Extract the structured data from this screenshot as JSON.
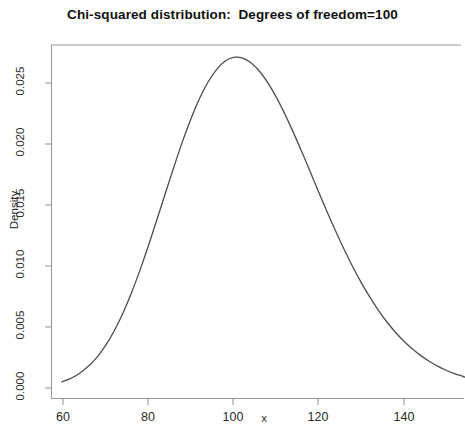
{
  "chart_data": {
    "type": "line",
    "title": "Chi-squared distribution:  Degrees of freedom=100",
    "xlabel": "x",
    "ylabel": "Density",
    "df": 100,
    "xlim": [
      60,
      155
    ],
    "ylim": [
      0,
      0.0285
    ],
    "xticks": [
      60,
      80,
      100,
      120,
      140
    ],
    "xtick_labels": [
      "60",
      "80",
      "100",
      "120",
      "140"
    ],
    "yticks": [
      0.0,
      0.005,
      0.01,
      0.015,
      0.02,
      0.025
    ],
    "ytick_labels": [
      "0.000",
      "0.005",
      "0.010",
      "0.015",
      "0.020",
      "0.025"
    ],
    "grid": false,
    "legend": "none",
    "line_color": "#4d4d4d",
    "axis_color": "#8c8c8c",
    "peak": {
      "x": 98,
      "y": 0.0271
    },
    "x": [
      60,
      62,
      64,
      66,
      68,
      70,
      72,
      74,
      76,
      78,
      80,
      82,
      84,
      86,
      88,
      90,
      92,
      94,
      96,
      98,
      100,
      102,
      104,
      106,
      108,
      110,
      112,
      114,
      116,
      118,
      120,
      122,
      124,
      126,
      128,
      130,
      132,
      134,
      136,
      138,
      140,
      142,
      144,
      146,
      148,
      150,
      152,
      154
    ],
    "y": [
      0.00027,
      0.00041,
      0.00062,
      0.0009,
      0.00127,
      0.00175,
      0.00234,
      0.00305,
      0.00388,
      0.00481,
      0.00582,
      0.0069,
      0.00799,
      0.00907,
      0.01011,
      0.01105,
      0.01188,
      0.01256,
      0.01308,
      0.01342,
      0.01358,
      0.01356,
      0.01337,
      0.01303,
      0.01255,
      0.01196,
      0.01127,
      0.01051,
      0.00971,
      0.00888,
      0.00804,
      0.00722,
      0.00643,
      0.00568,
      0.00497,
      0.00432,
      0.00373,
      0.00319,
      0.00271,
      0.00229,
      0.00192,
      0.0016,
      0.00132,
      0.00109,
      0.00089,
      0.00072,
      0.00058,
      0.00047
    ],
    "y_scale_note": "plotted density values scaled to peak 0.0271"
  },
  "axes": {
    "x_tick_pixels": [
      63,
      148,
      233,
      318,
      404
    ],
    "y_tick_pixels": [
      388,
      327,
      266,
      205,
      144,
      83
    ]
  }
}
